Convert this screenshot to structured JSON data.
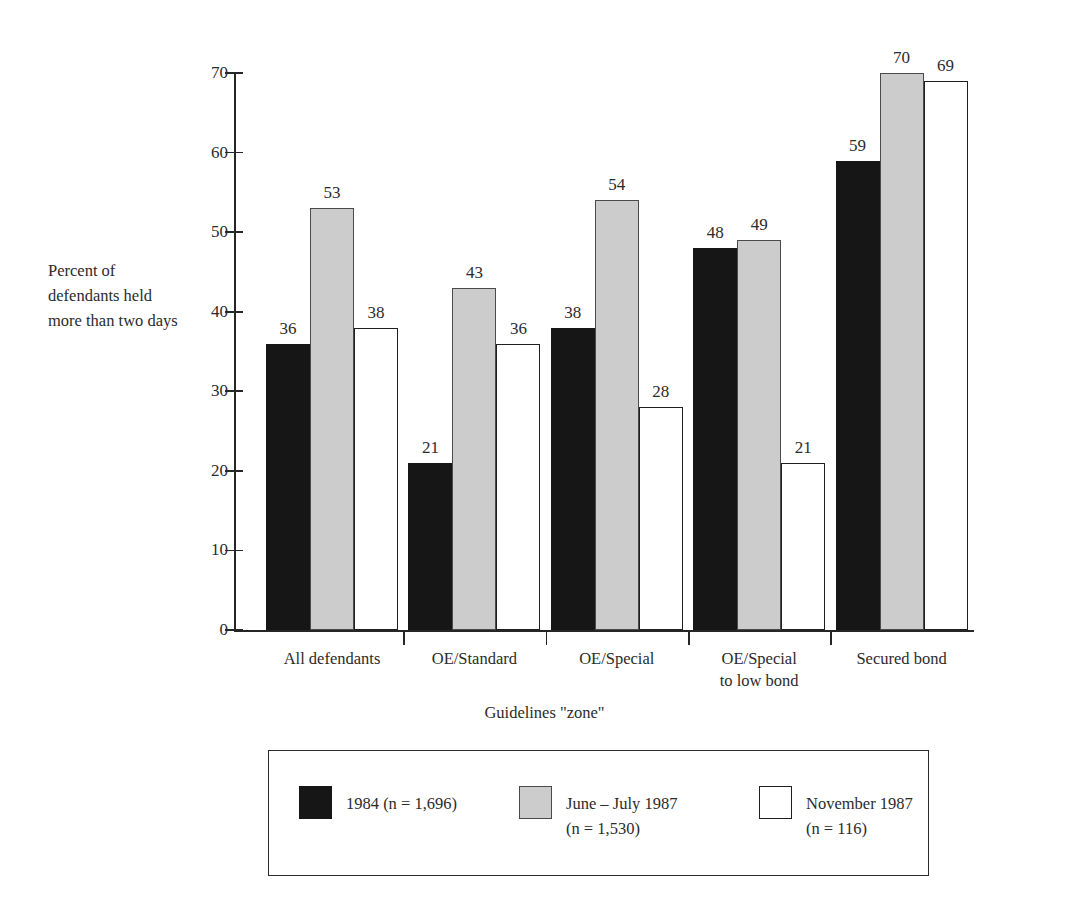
{
  "chart_data": {
    "type": "bar",
    "title": "",
    "subtitle": "",
    "xlabel": "Guidelines \"zone\"",
    "ylabel": "Percent of\ndefendants held\nmore than two days",
    "categories": [
      "All defendants",
      "OE/Standard",
      "OE/Special",
      "OE/Special\nto low bond",
      "Secured bond"
    ],
    "series": [
      {
        "name": "1984 (n = 1,696)",
        "values": [
          36,
          21,
          38,
          48,
          59
        ],
        "color": "#161616"
      },
      {
        "name": "June – July 1987\n(n = 1,530)",
        "values": [
          53,
          43,
          54,
          49,
          70
        ],
        "color": "#cccccc"
      },
      {
        "name": "November 1987\n(n = 116)",
        "values": [
          38,
          36,
          28,
          21,
          69
        ],
        "color": "#ffffff"
      }
    ],
    "ylim": [
      0,
      70
    ],
    "yticks": [
      0,
      10,
      20,
      30,
      40,
      50,
      60,
      70
    ],
    "ytick_labels": [
      "0",
      "10",
      "20",
      "30",
      "40",
      "50",
      "60",
      "70"
    ],
    "grid": false,
    "legend_position": "bottom",
    "value_labels": true
  },
  "legend": {
    "entries": [
      {
        "swatch": "black-filled-square",
        "label": "1984 (n = 1,696)"
      },
      {
        "swatch": "gray-filled-square",
        "label": "June – July 1987\n(n = 1,530)"
      },
      {
        "swatch": "white-outlined-square",
        "label": "November 1987\n(n = 116)"
      }
    ]
  }
}
